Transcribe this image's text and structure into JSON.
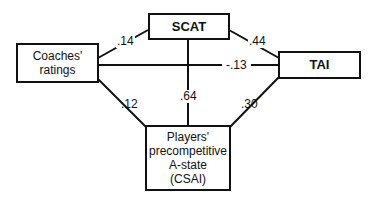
{
  "nodes": {
    "scat": {
      "label": "SCAT"
    },
    "coaches": {
      "line1": "Coaches'",
      "line2": "ratings"
    },
    "tai": {
      "label": "TAI"
    },
    "players": {
      "line1": "Players'",
      "line2": "precompetitive",
      "line3": "A-state",
      "line4": "(CSAI)"
    }
  },
  "edges": {
    "coaches_scat": ".14",
    "scat_tai": ".44",
    "coaches_tai": "-.13",
    "coaches_players": ".12",
    "scat_players": ".64",
    "tai_players": ".30"
  }
}
